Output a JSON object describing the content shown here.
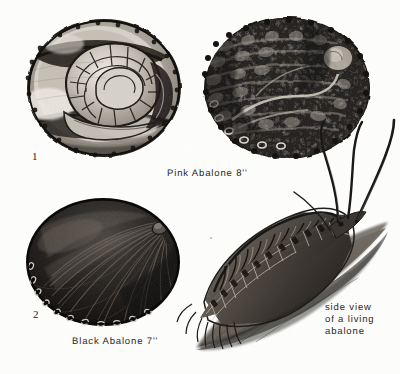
{
  "plate": {
    "background_color": "#fdfdfc",
    "ink_color": "#2a2724",
    "width": 400,
    "height": 374
  },
  "figures": [
    {
      "id": "pink-abalone-interior",
      "number": "1",
      "view": "interior nacre view",
      "common_name": "Pink Abalone",
      "size_label": "8''"
    },
    {
      "id": "pink-abalone-exterior",
      "number": "",
      "view": "exterior view",
      "common_name": "Pink Abalone",
      "size_label": "8''"
    },
    {
      "id": "black-abalone-exterior",
      "number": "2",
      "view": "exterior view",
      "common_name": "Black Abalone",
      "size_label": "7''"
    },
    {
      "id": "living-abalone-side",
      "number": "",
      "view": "side view of a living abalone",
      "common_name": "",
      "size_label": ""
    }
  ],
  "captions": {
    "pink_abalone": "Pink Abalone 8''",
    "black_abalone": "Black Abalone 7''",
    "side_view_line1": "side view",
    "side_view_line2": "of a living",
    "side_view_line3": "abalone"
  },
  "figure_numbers": {
    "one": "1",
    "two": "2"
  }
}
